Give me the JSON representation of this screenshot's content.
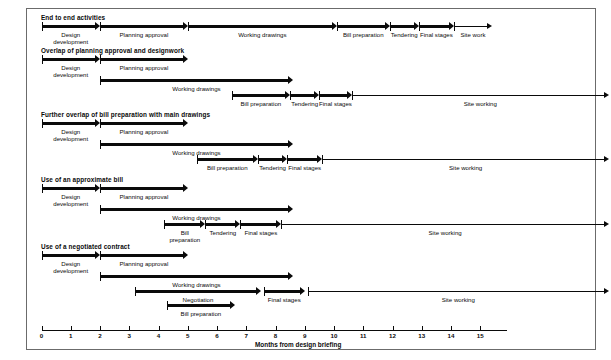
{
  "figure": {
    "axis_caption": "Months from design briefing",
    "axis": {
      "min": 0,
      "max": 15,
      "ticks": [
        "0",
        "1",
        "2",
        "3",
        "4",
        "5",
        "6",
        "7",
        "8",
        "9",
        "10",
        "11",
        "12",
        "13",
        "14",
        "15"
      ]
    }
  },
  "sections": [
    {
      "title": "End to end activities",
      "rows": [
        {
          "bars": [
            {
              "label": "Design\ndevelopment",
              "start": 0,
              "end": 2,
              "style": "thick"
            },
            {
              "label": "Planning approval",
              "start": 2,
              "end": 5,
              "style": "thick"
            },
            {
              "label": "Working drawings",
              "start": 5,
              "end": 10.1,
              "style": "thick"
            },
            {
              "label": "Bill preparation",
              "start": 10.1,
              "end": 11.9,
              "style": "thick"
            },
            {
              "label": "Tendering",
              "start": 11.9,
              "end": 12.9,
              "style": "thick"
            },
            {
              "label": "Final stages",
              "start": 12.9,
              "end": 14.1,
              "style": "thick"
            },
            {
              "label": "Site work",
              "start": 14.1,
              "end": 15.4,
              "style": "thin"
            }
          ]
        }
      ]
    },
    {
      "title": "Overlap of planning approval and designwork",
      "rows": [
        {
          "bars": [
            {
              "label": "Design\ndevelopment",
              "start": 0,
              "end": 2,
              "style": "thick"
            },
            {
              "label": "Planning approval",
              "start": 2,
              "end": 5,
              "style": "thick"
            }
          ]
        },
        {
          "bars": [
            {
              "label": "Working drawings",
              "start": 2,
              "end": 8.6,
              "style": "thick"
            }
          ]
        },
        {
          "bars": [
            {
              "label": "Bill preparation",
              "start": 6.5,
              "end": 8.5,
              "style": "thick"
            },
            {
              "label": "Tendering",
              "start": 8.5,
              "end": 9.5,
              "style": "thick"
            },
            {
              "label": "Final stages",
              "start": 9.5,
              "end": 10.6,
              "style": "thick"
            },
            {
              "label": "Site working",
              "start": 10.6,
              "end": 19.4,
              "style": "thin"
            }
          ]
        }
      ]
    },
    {
      "title": "Further overlap of bill preparation with main drawings",
      "rows": [
        {
          "bars": [
            {
              "label": "Design\ndevelopment",
              "start": 0,
              "end": 2,
              "style": "thick"
            },
            {
              "label": "Planning approval",
              "start": 2,
              "end": 5,
              "style": "thick"
            }
          ]
        },
        {
          "bars": [
            {
              "label": "Working drawings",
              "start": 2,
              "end": 8.6,
              "style": "thick"
            }
          ]
        },
        {
          "bars": [
            {
              "label": "Bill preparation",
              "start": 5.3,
              "end": 7.4,
              "style": "thick"
            },
            {
              "label": "Tendering",
              "start": 7.4,
              "end": 8.4,
              "style": "thick"
            },
            {
              "label": "Final stages",
              "start": 8.4,
              "end": 9.6,
              "style": "thick"
            },
            {
              "label": "Site working",
              "start": 9.6,
              "end": 19.4,
              "style": "thin"
            }
          ]
        }
      ]
    },
    {
      "title": "Use of an approximate bill",
      "rows": [
        {
          "bars": [
            {
              "label": "Design\ndevelopment",
              "start": 0,
              "end": 2,
              "style": "thick"
            },
            {
              "label": "Planning approval",
              "start": 2,
              "end": 5,
              "style": "thick"
            }
          ]
        },
        {
          "bars": [
            {
              "label": "Working drawings",
              "start": 2,
              "end": 8.6,
              "style": "thick"
            }
          ]
        },
        {
          "bars": [
            {
              "label": "Bill\npreparation",
              "start": 4.2,
              "end": 5.6,
              "style": "thick"
            },
            {
              "label": "Tendering",
              "start": 5.6,
              "end": 6.8,
              "style": "thick"
            },
            {
              "label": "Final stages",
              "start": 6.8,
              "end": 8.2,
              "style": "thick"
            },
            {
              "label": "Site working",
              "start": 8.2,
              "end": 19.4,
              "style": "thin"
            }
          ]
        }
      ]
    },
    {
      "title": "Use of a negotiated contract",
      "rows": [
        {
          "bars": [
            {
              "label": "Design\ndevelopment",
              "start": 0,
              "end": 2,
              "style": "thick"
            },
            {
              "label": "Planning approval",
              "start": 2,
              "end": 5,
              "style": "thick"
            }
          ]
        },
        {
          "bars": [
            {
              "label": "Working drawings",
              "start": 2,
              "end": 8.6,
              "style": "thick"
            }
          ]
        },
        {
          "bars": [
            {
              "label": "Negotiation",
              "start": 3.2,
              "end": 7.5,
              "style": "thick"
            },
            {
              "label": "Final stages",
              "start": 7.6,
              "end": 9.0,
              "style": "thick"
            },
            {
              "label": "Site working",
              "start": 9.1,
              "end": 19.4,
              "style": "thin"
            }
          ]
        },
        {
          "bars": [
            {
              "label": "Bill preparation",
              "start": 4.3,
              "end": 6.6,
              "style": "thick"
            }
          ]
        }
      ]
    }
  ]
}
